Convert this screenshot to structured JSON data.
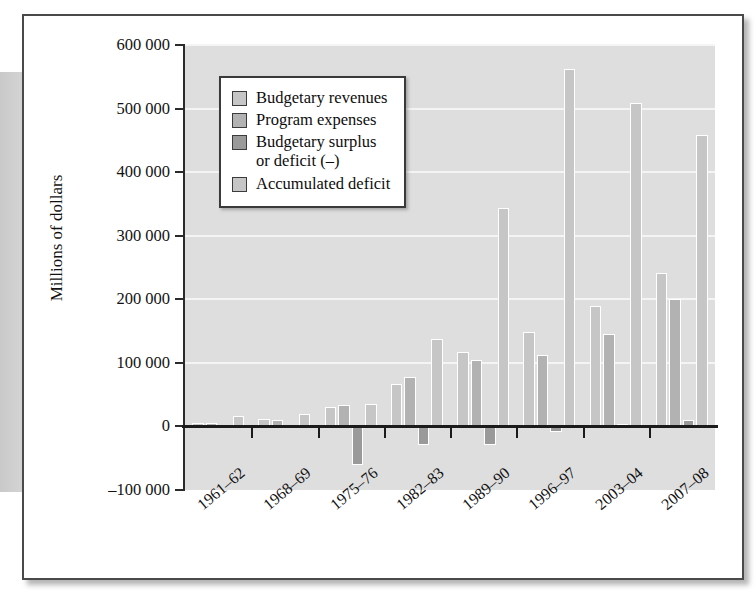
{
  "figure": {
    "background_color": "#ffffff",
    "frame_color": "#4a4a4a",
    "plot_background": "#dedede",
    "gridline_color": "#f4f4f4"
  },
  "legend": {
    "position": "top-left-inside",
    "items": [
      {
        "label": "Budgetary revenues",
        "color": "#c6c6c6",
        "swatch_name": "legend-swatch-budgetary-revenues"
      },
      {
        "label": "Program expenses",
        "color": "#b2b2b2",
        "swatch_name": "legend-swatch-program-expenses"
      },
      {
        "label": "Budgetary surplus\nor deficit (–)",
        "color": "#9a9a9a",
        "swatch_name": "legend-swatch-budgetary-surplus-or-deficit"
      },
      {
        "label": "Accumulated deficit",
        "color": "#c6c6c6",
        "swatch_name": "legend-swatch-accumulated-deficit"
      }
    ]
  },
  "chart_data": {
    "type": "bar",
    "title": "",
    "subtitle": "",
    "xlabel": "",
    "ylabel": "Millions of dollars",
    "ylim": [
      -100000,
      600000
    ],
    "ytick_step": 100000,
    "ytick_labels": [
      "600 000",
      "500 000",
      "400 000",
      "300 000",
      "200 000",
      "100 000",
      "0",
      "–100 000"
    ],
    "ytick_values": [
      600000,
      500000,
      400000,
      300000,
      200000,
      100000,
      0,
      -100000
    ],
    "grid": true,
    "grid_axis": "y",
    "legend_position": "upper left",
    "categories": [
      "1961–62",
      "1968–69",
      "1975–76",
      "1982–83",
      "1989–90",
      "1996–97",
      "2003–04",
      "2007–08"
    ],
    "series": [
      {
        "name": "Budgetary revenues",
        "color": "#c6c6c6",
        "values": [
          6000,
          12000,
          31000,
          67000,
          117000,
          149000,
          190000,
          242000
        ]
      },
      {
        "name": "Program expenses",
        "color": "#b2b2b2",
        "values": [
          6000,
          10000,
          34000,
          78000,
          104000,
          112000,
          146000,
          200000
        ]
      },
      {
        "name": "Budgetary surplus or deficit (–)",
        "color": "#9a9a9a",
        "values": [
          -1000,
          -1000,
          -60000,
          -29000,
          -29000,
          -9000,
          4000,
          10000
        ]
      },
      {
        "name": "Accumulated deficit",
        "color": "#c6c6c6",
        "values": [
          17000,
          19000,
          35000,
          137000,
          343000,
          563000,
          508000,
          458000
        ]
      }
    ]
  }
}
